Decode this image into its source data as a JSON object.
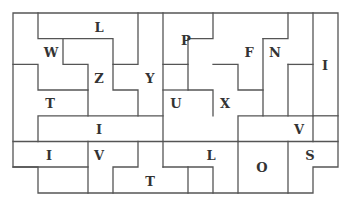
{
  "puzzle": {
    "type": "pentomino-tiling",
    "grid": {
      "cols": 13,
      "rows": 7,
      "origin_x": 13,
      "origin_y": 13,
      "cell_w": 25,
      "cell_h": 25.7
    },
    "line_color": "#555555",
    "text_color": "#333333",
    "pieces": [
      {
        "letter": "L",
        "x": 99,
        "y": 27
      },
      {
        "letter": "W",
        "x": 51,
        "y": 52
      },
      {
        "letter": "Z",
        "x": 99,
        "y": 78
      },
      {
        "letter": "Y",
        "x": 150,
        "y": 78
      },
      {
        "letter": "T",
        "x": 50,
        "y": 103
      },
      {
        "letter": "I",
        "x": 99,
        "y": 129
      },
      {
        "letter": "I",
        "x": 49,
        "y": 155
      },
      {
        "letter": "V",
        "x": 99,
        "y": 155
      },
      {
        "letter": "T",
        "x": 150,
        "y": 181
      },
      {
        "letter": "P",
        "x": 186,
        "y": 40
      },
      {
        "letter": "F",
        "x": 249,
        "y": 52
      },
      {
        "letter": "N",
        "x": 275,
        "y": 52
      },
      {
        "letter": "I",
        "x": 325,
        "y": 65
      },
      {
        "letter": "U",
        "x": 176,
        "y": 103
      },
      {
        "letter": "X",
        "x": 225,
        "y": 103
      },
      {
        "letter": "V",
        "x": 299,
        "y": 129
      },
      {
        "letter": "L",
        "x": 211,
        "y": 155
      },
      {
        "letter": "O",
        "x": 262,
        "y": 167
      },
      {
        "letter": "S",
        "x": 310,
        "y": 155
      }
    ]
  }
}
